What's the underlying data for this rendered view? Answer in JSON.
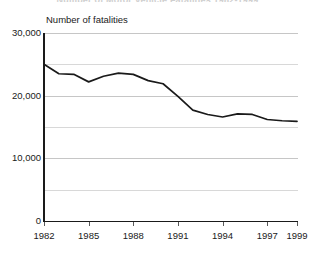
{
  "chart_data": {
    "type": "line",
    "title": "Number of Motor Vehicle Fatalities 1982-1999",
    "title_visible_fragment": "",
    "subtitle": "",
    "xlabel": "",
    "ylabel": "Number of fatalities",
    "ylim": [
      0,
      30000
    ],
    "xlim": [
      1982,
      1999
    ],
    "grid": true,
    "gridlines_major": [
      0,
      10000,
      20000,
      30000
    ],
    "gridlines_minor": [
      5000,
      15000,
      25000
    ],
    "legend": null,
    "legend_position": "none",
    "x": [
      1982,
      1983,
      1984,
      1985,
      1986,
      1987,
      1988,
      1989,
      1990,
      1991,
      1992,
      1993,
      1994,
      1995,
      1996,
      1997,
      1998,
      1999
    ],
    "values": [
      25000,
      23500,
      23400,
      22200,
      23100,
      23600,
      23400,
      22400,
      21900,
      19900,
      17700,
      17000,
      16600,
      17100,
      17000,
      16200,
      16000,
      15900
    ],
    "series": [
      {
        "name": "Number of fatalities",
        "color": "#1a1a1a",
        "values": [
          25000,
          23500,
          23400,
          22200,
          23100,
          23600,
          23400,
          22400,
          21900,
          19900,
          17700,
          17000,
          16600,
          17100,
          17000,
          16200,
          16000,
          15900
        ]
      }
    ],
    "ytick_labels": [
      "30,000",
      "20,000",
      "10,000",
      "0"
    ],
    "ytick_values": [
      30000,
      20000,
      10000,
      0
    ],
    "xtick_labels": [
      "1982",
      "1985",
      "1988",
      "1991",
      "1994",
      "1997",
      "1999"
    ],
    "xtick_values": [
      1982,
      1985,
      1988,
      1991,
      1994,
      1997,
      1999
    ]
  },
  "axis": {
    "y_caption": "Number of fatalities"
  },
  "colors": {
    "line": "#1a1a1a",
    "axis": "#1a1a1a",
    "grid_major": "#c6c6c6",
    "grid_minor": "#d8d8d8",
    "background": "#ffffff",
    "text": "#1a1a1a"
  }
}
